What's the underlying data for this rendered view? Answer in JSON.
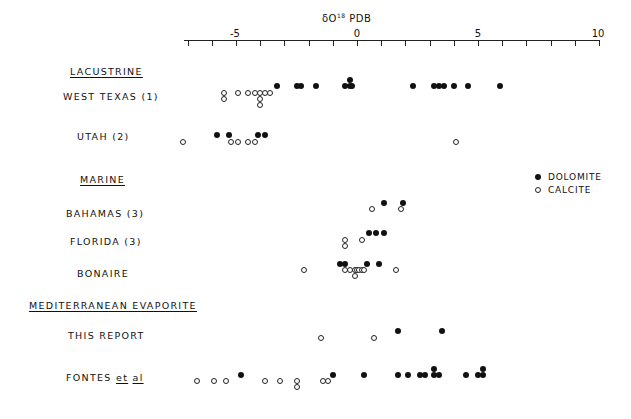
{
  "chart_data": {
    "type": "scatter",
    "title": "",
    "xlabel": "δO18 PDB",
    "ylabel": "",
    "xlim": [
      -7,
      10
    ],
    "x_ticks": [
      -5,
      0,
      5,
      10
    ],
    "grid": false,
    "legend": {
      "position": "right",
      "entries": [
        {
          "name": "DOLOMITE",
          "marker": "filled-circle"
        },
        {
          "name": "CALCITE",
          "marker": "open-circle"
        }
      ]
    },
    "groups": [
      {
        "name": "LACUSTRINE",
        "rows": [
          "WEST TEXAS (1)",
          "UTAH (2)"
        ]
      },
      {
        "name": "MARINE",
        "rows": [
          "BAHAMAS (3)",
          "FLORIDA (3)",
          "BONAIRE"
        ]
      },
      {
        "name": "MEDITERRANEAN EVAPORITE",
        "rows": [
          "THIS REPORT",
          "FONTES et al"
        ]
      }
    ],
    "series": [
      {
        "row": "WEST TEXAS (1)",
        "calcite": [
          -5.5,
          -5.5,
          -4.9,
          -4.5,
          -4.2,
          -4.0,
          -4.0,
          -4.0,
          -3.8,
          -3.6
        ],
        "dolomite": [
          -3.3,
          -2.5,
          -2.3,
          -1.7,
          -0.5,
          -0.3,
          -0.3,
          -0.2,
          2.3,
          3.2,
          3.4,
          3.6,
          4.0,
          4.6,
          5.9
        ]
      },
      {
        "row": "UTAH (2)",
        "calcite": [
          -7.2,
          -5.2,
          -4.9,
          -4.5,
          -4.2,
          4.1
        ],
        "dolomite": [
          -5.8,
          -5.3,
          -4.1,
          -3.8
        ]
      },
      {
        "row": "BAHAMAS (3)",
        "calcite": [
          0.6,
          1.8
        ],
        "dolomite": [
          1.1,
          1.9
        ]
      },
      {
        "row": "FLORIDA (3)",
        "calcite": [
          -0.5,
          -0.5,
          0.2
        ],
        "dolomite": [
          0.5,
          0.8,
          1.1
        ]
      },
      {
        "row": "BONAIRE",
        "calcite": [
          -2.2,
          -0.5,
          -0.3,
          -0.1,
          0.0,
          0.1,
          0.2,
          0.3,
          -0.1,
          1.6
        ],
        "dolomite": [
          -0.7,
          -0.5,
          0.4,
          0.9
        ]
      },
      {
        "row": "THIS REPORT",
        "calcite": [
          -1.5,
          0.7
        ],
        "dolomite": [
          1.7,
          3.5
        ]
      },
      {
        "row": "FONTES et al",
        "calcite": [
          -6.6,
          -5.9,
          -5.4,
          -3.8,
          -3.2,
          -2.5,
          -2.5,
          -1.4,
          -1.2
        ],
        "dolomite": [
          -4.8,
          -1.0,
          0.3,
          1.7,
          2.1,
          2.6,
          2.8,
          3.2,
          3.2,
          3.4,
          4.5,
          5.0,
          5.2,
          5.2
        ]
      }
    ]
  },
  "axis": {
    "title_prefix": "δO",
    "title_sup": "18",
    "title_suffix": " PDB",
    "ticks": [
      {
        "label": "-5"
      },
      {
        "label": "0"
      },
      {
        "label": "5"
      },
      {
        "label": "10"
      }
    ]
  },
  "labels": {
    "lacustrine": "LACUSTRINE",
    "west_texas": "WEST TEXAS (1)",
    "utah": "UTAH (2)",
    "marine": "MARINE",
    "bahamas": "BAHAMAS (3)",
    "florida": "FLORIDA (3)",
    "bonaire": "BONAIRE",
    "mediterranean": "MEDITERRANEAN EVAPORITE",
    "this_report": "THIS REPORT",
    "fontes": "FONTES",
    "fontes_et": "et",
    "fontes_al": "al"
  },
  "legend": {
    "dolomite": "DOLOMITE",
    "calcite": "CALCITE"
  }
}
